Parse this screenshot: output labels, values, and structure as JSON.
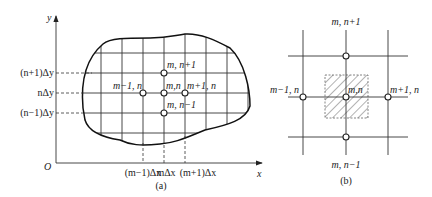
{
  "figure_a": {
    "caption": "(a)",
    "axes": {
      "x_label": "x",
      "y_label": "y",
      "origin_label": "O"
    },
    "y_ticks": [
      "(n+1)Δy",
      "nΔy",
      "(n−1)Δy"
    ],
    "x_ticks": [
      "(m−1)Δx",
      "mΔx",
      "(m+1)Δx"
    ],
    "nodes": {
      "center": "m,n",
      "top": "m, n+1",
      "bottom": "m, n−1",
      "left": "m−1, n",
      "right": "m+1, n"
    }
  },
  "figure_b": {
    "caption": "(b)",
    "nodes": {
      "center": "m,n",
      "top": "m, n+1",
      "bottom": "m, n−1",
      "left": "m−1, n",
      "right": "m+1, n"
    },
    "hatched_region": "control volume around node m,n"
  }
}
